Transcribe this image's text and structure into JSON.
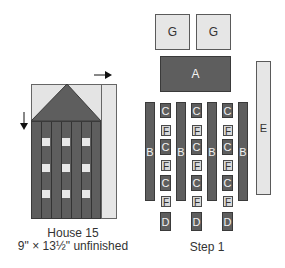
{
  "house": {
    "title": "House 15",
    "dimensions": "9\" × 13½\" unfinished",
    "arrow_horizontal": "right-arrow",
    "arrow_vertical": "down-arrow"
  },
  "step": {
    "title": "Step 1",
    "pieces": {
      "G": "G",
      "A": "A",
      "B": "B",
      "C": "C",
      "D": "D",
      "E": "E",
      "F": "F"
    }
  },
  "colors": {
    "dark_fabric": "#5e5e5e",
    "light_fabric": "#e6e6e6",
    "outline": "#3a3a3a"
  }
}
